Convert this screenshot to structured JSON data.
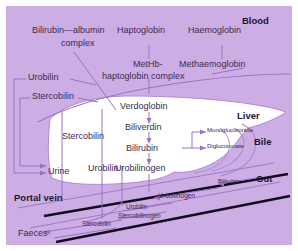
{
  "diagram": {
    "panel_bg": "#cdaee4",
    "organ_fill": "#ffffff",
    "line_color": "#9a72c4",
    "text_color": "#3b2a52",
    "heading_color": "#1d1430",
    "vessel_color": "#0e0a18"
  },
  "regions": [
    {
      "name": "blood",
      "label": "Blood"
    },
    {
      "name": "liver",
      "label": "Liver"
    },
    {
      "name": "bile",
      "label": "Bile"
    },
    {
      "name": "gut",
      "label": "Gut"
    },
    {
      "name": "portal-vein",
      "label": "Portal vein"
    }
  ],
  "nodes": {
    "bilirubin_albumin_1": "Bilirubin—albumin",
    "bilirubin_albumin_2": "complex",
    "haptoglobin": "Haptoglobin",
    "haemoglobin": "Haemoglobin",
    "methb_1": "MetHb-",
    "methb_2": "haptoglobin complex",
    "methaemoglobin": "Methaemoglobin",
    "urobilin_left": "Urobilin",
    "stercobilin_left": "Stercobilin",
    "verdoglobin": "Verdoglobin",
    "biliverdin": "Biliverdin",
    "bilirubin_liver": "Bilirubin",
    "urobilinogen_liver": "Urobilinogen",
    "monoglucuronide": "Monoglucuronide",
    "diglucuronate": "Diglucuronate",
    "stercobilin_liver": "Stercobilin",
    "urobilin_liver": "Urobilin",
    "urine": "Urine",
    "faeces": "Faeces",
    "bilirubin_gut": "Bilirubin",
    "urobilinogen_gut": "Urobilinogen",
    "urobilin_gut": "Urobilin",
    "stercobilinogen_gut": "Stercobilinogen",
    "stercobilin_gut": "Stercobilin"
  }
}
